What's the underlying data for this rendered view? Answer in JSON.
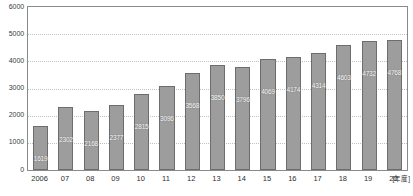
{
  "chart_data": {
    "type": "bar",
    "title": "",
    "xlabel": "[年度]",
    "ylabel": "",
    "ylim": [
      0,
      6000
    ],
    "yticks": [
      0,
      1000,
      2000,
      3000,
      4000,
      5000,
      6000
    ],
    "ytick_labels": [
      "0",
      "1000",
      "2000",
      "3000",
      "4000",
      "5000",
      "6000"
    ],
    "grid": true,
    "legend": "none",
    "categories": [
      "2006",
      "07",
      "08",
      "09",
      "10",
      "11",
      "12",
      "13",
      "14",
      "15",
      "16",
      "17",
      "18",
      "19",
      "20"
    ],
    "values": [
      1619,
      2302,
      2168,
      2377,
      2815,
      3096,
      3568,
      3850,
      3796,
      4069,
      4174,
      4314,
      4603,
      4732,
      4768
    ],
    "value_labels": [
      "1619",
      "2302",
      "2168",
      "2377",
      "2815",
      "3096",
      "3568",
      "3850",
      "3796",
      "4069",
      "4174",
      "4314",
      "4603",
      "4732",
      "4768"
    ],
    "colors": {
      "bar_fill": "#9d9d9d",
      "bar_stroke": "#6d6d6d",
      "value_label": "#ffffff",
      "gridline": "#c0c0c0",
      "axis": "#8a8a8a",
      "tick_text": "#2e2e2e",
      "background": "#ffffff"
    }
  }
}
